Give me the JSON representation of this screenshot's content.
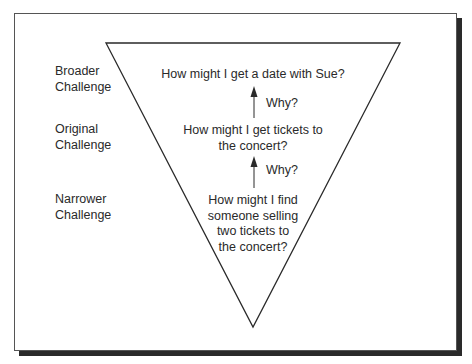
{
  "diagram": {
    "type": "inverted-triangle-ladder",
    "levels": [
      {
        "label_line1": "Broader",
        "label_line2": "Challenge",
        "question_lines": [
          "How might I get a date with Sue?"
        ]
      },
      {
        "label_line1": "Original",
        "label_line2": "Challenge",
        "question_lines": [
          "How might I get tickets to",
          "the concert?"
        ]
      },
      {
        "label_line1": "Narrower",
        "label_line2": "Challenge",
        "question_lines": [
          "How might I find",
          "someone selling",
          "two tickets to",
          "the concert?"
        ]
      }
    ],
    "arrows": [
      {
        "label": "Why?",
        "direction": "up"
      },
      {
        "label": "Why?",
        "direction": "up"
      }
    ],
    "colors": {
      "line": "#2a2a2a",
      "shadow": "#2a2a2a",
      "frame": "#555555",
      "background": "#ffffff"
    }
  }
}
